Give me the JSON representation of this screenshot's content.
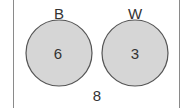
{
  "diagram": {
    "type": "venn",
    "sets": [
      {
        "label": "B",
        "value": "6"
      },
      {
        "label": "W",
        "value": "3"
      }
    ],
    "outside_value": "8",
    "colors": {
      "fill": "#d6d6d6",
      "stroke": "#555555",
      "border": "#8a8a8a"
    }
  }
}
